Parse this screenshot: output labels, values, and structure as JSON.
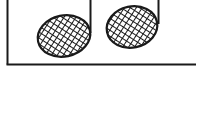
{
  "figure": {
    "notes": [
      {
        "head": {
          "cx": 64,
          "cy": 36,
          "rx": 27,
          "ry": 21
        },
        "stem": {
          "x": 90.5,
          "y1": 0,
          "y2": 34
        }
      },
      {
        "head": {
          "cx": 132,
          "cy": 27,
          "rx": 26,
          "ry": 21
        },
        "stem": {
          "x": 158.5,
          "y1": 0,
          "y2": 25
        }
      }
    ],
    "frame": {
      "left_x": 7.5,
      "bottom_y": 64.5,
      "right_x": 196
    },
    "colors": {
      "ink": "#1a1a1a",
      "background": "#ffffff"
    }
  }
}
